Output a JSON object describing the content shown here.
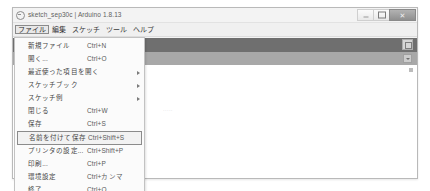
{
  "window": {
    "title": "sketch_sep30c | Arduino 1.8.13",
    "logo_icon": "arduino-logo-icon",
    "controls": {
      "minimize_glyph": "minimize-icon",
      "maximize_glyph": "maximize-icon",
      "close_glyph": "✕"
    }
  },
  "menubar": {
    "items": [
      {
        "label": "ファイル",
        "name": "menu-file",
        "active": true
      },
      {
        "label": "編集",
        "name": "menu-edit",
        "active": false
      },
      {
        "label": "スケッチ",
        "name": "menu-sketch",
        "active": false
      },
      {
        "label": "ツール",
        "name": "menu-tools",
        "active": false
      },
      {
        "label": "ヘルプ",
        "name": "menu-help",
        "active": false
      }
    ]
  },
  "file_menu": {
    "items": [
      {
        "label": "新規ファイル",
        "accel": "Ctrl+N",
        "submenu": false,
        "selected": false,
        "name": "file-menu-item-new"
      },
      {
        "label": "開く...",
        "accel": "Ctrl+O",
        "submenu": false,
        "selected": false,
        "name": "file-menu-item-open"
      },
      {
        "label": "最近使った項目を開く",
        "accel": "",
        "submenu": true,
        "selected": false,
        "name": "file-menu-item-open-recent"
      },
      {
        "label": "スケッチブック",
        "accel": "",
        "submenu": true,
        "selected": false,
        "name": "file-menu-item-sketchbook"
      },
      {
        "label": "スケッチ例",
        "accel": "",
        "submenu": true,
        "selected": false,
        "name": "file-menu-item-examples"
      },
      {
        "label": "閉じる",
        "accel": "Ctrl+W",
        "submenu": false,
        "selected": false,
        "name": "file-menu-item-close"
      },
      {
        "label": "保存",
        "accel": "Ctrl+S",
        "submenu": false,
        "selected": false,
        "name": "file-menu-item-save"
      },
      {
        "label": "名前を付けて保存",
        "accel": "Ctrl+Shift+S",
        "submenu": false,
        "selected": true,
        "name": "file-menu-item-save-as"
      },
      {
        "label": "プリンタの設定...",
        "accel": "Ctrl+Shift+P",
        "submenu": false,
        "selected": false,
        "name": "file-menu-item-page-setup"
      },
      {
        "label": "印刷...",
        "accel": "Ctrl+P",
        "submenu": false,
        "selected": false,
        "name": "file-menu-item-print"
      },
      {
        "label": "環境設定",
        "accel": "Ctrl+カンマ",
        "submenu": false,
        "selected": false,
        "name": "file-menu-item-preferences"
      },
      {
        "label": "終了",
        "accel": "Ctrl+Q",
        "submenu": false,
        "selected": false,
        "name": "file-menu-item-quit"
      }
    ]
  },
  "workspace": {
    "toolbar_name": "editor-toolbar",
    "serial_monitor_icon": "serial-monitor-icon",
    "tab_dropdown_icon": "chevron-down-icon",
    "ghost_text": "·····"
  },
  "colors": {
    "toolbar": "#6f6f6f",
    "tabbar": "#a8a8a8",
    "menu_bg": "#fbfbfb",
    "window_bg": "#f4f4f4",
    "close_button": "#9b9b9b"
  }
}
